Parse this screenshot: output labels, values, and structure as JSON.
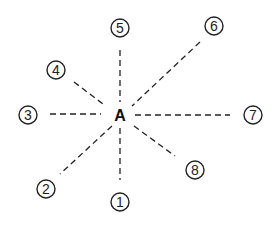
{
  "diagram": {
    "center_label": "A",
    "nodes": [
      {
        "label": "1",
        "x": 120,
        "y": 202
      },
      {
        "label": "2",
        "x": 46,
        "y": 189
      },
      {
        "label": "3",
        "x": 28,
        "y": 115
      },
      {
        "label": "4",
        "x": 56,
        "y": 70
      },
      {
        "label": "5",
        "x": 120,
        "y": 28
      },
      {
        "label": "6",
        "x": 214,
        "y": 26
      },
      {
        "label": "7",
        "x": 253,
        "y": 115
      },
      {
        "label": "8",
        "x": 195,
        "y": 170
      }
    ]
  }
}
